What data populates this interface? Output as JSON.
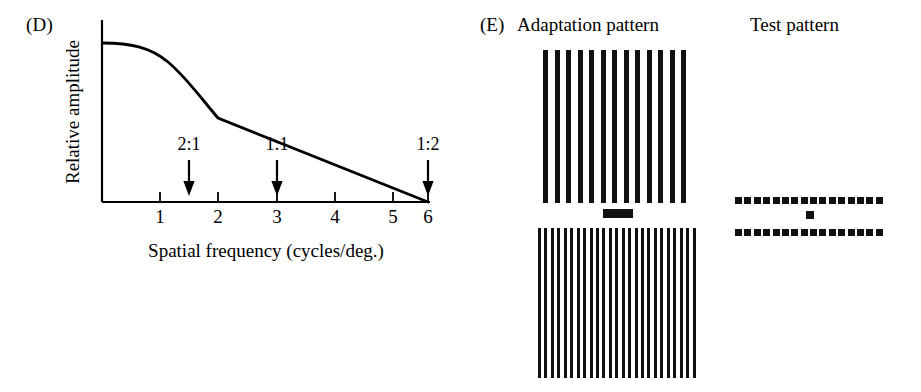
{
  "figure": {
    "panels": [
      {
        "id": "D",
        "label": "(D)"
      },
      {
        "id": "E",
        "label": "(E)"
      }
    ]
  },
  "panel_d": {
    "label": "(D)",
    "ylabel": "Relative amplitude",
    "xlabel": "Spatial frequency (cycles/deg.)",
    "xticks": [
      "1",
      "2",
      "3",
      "4",
      "5",
      "6"
    ],
    "annotations": [
      {
        "text": "2:1",
        "x": 1.5
      },
      {
        "text": "1:1",
        "x": 3.0
      },
      {
        "text": "1:2",
        "x": 6.0
      }
    ]
  },
  "panel_e": {
    "label": "(E)",
    "adaptation_title": "Adaptation pattern",
    "test_title": "Test pattern",
    "adaptation_top_bars": 13,
    "adaptation_bottom_bars": 25,
    "test_dashes_per_row": 16,
    "fixation_marker": "horizontal-bar",
    "test_fixation_marker": "small-square"
  },
  "colors": {
    "ink": "#111111",
    "background": "#ffffff",
    "axis": "#000000"
  },
  "chart_data": {
    "type": "line",
    "title": "",
    "xlabel": "Spatial frequency (cycles/deg.)",
    "ylabel": "Relative amplitude",
    "xlim": [
      0,
      6.35
    ],
    "ylim": [
      0,
      1.08
    ],
    "xticks": [
      1,
      2,
      3,
      4,
      5,
      6
    ],
    "yticks": [],
    "grid": false,
    "legend": null,
    "series": [
      {
        "name": "Contrast sensitivity envelope",
        "x": [
          0.0,
          0.25,
          0.5,
          0.75,
          1.0,
          1.25,
          1.5,
          1.75,
          2.0,
          2.5,
          3.0,
          3.5,
          4.0,
          4.5,
          5.0,
          5.5,
          6.0
        ],
        "y": [
          1.0,
          1.0,
          0.99,
          0.975,
          0.95,
          0.915,
          0.87,
          0.815,
          0.755,
          0.63,
          0.505,
          0.42,
          0.335,
          0.25,
          0.17,
          0.085,
          0.0
        ]
      }
    ],
    "annotations": [
      {
        "text": "2:1",
        "x": 1.5,
        "type": "arrow-down"
      },
      {
        "text": "1:1",
        "x": 3.0,
        "type": "arrow-down"
      },
      {
        "text": "1:2",
        "x": 6.0,
        "type": "arrow-down"
      }
    ]
  }
}
